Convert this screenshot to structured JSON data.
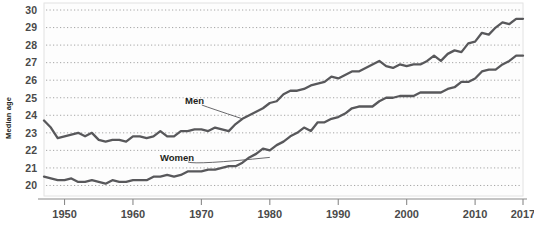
{
  "chart_data": {
    "type": "line",
    "title": "",
    "subtitle": "",
    "xlabel": "",
    "ylabel": "Median age",
    "xlim": [
      1947,
      2017
    ],
    "ylim": [
      19.4,
      30.4
    ],
    "grid": true,
    "legend_position": "inline-annotation",
    "x_ticks": [
      "1950",
      "1960",
      "1970",
      "1980",
      "1990",
      "2000",
      "2010",
      "2017"
    ],
    "x_tick_values": [
      1950,
      1960,
      1970,
      1980,
      1990,
      2000,
      2010,
      2017
    ],
    "y_ticks": [
      "20",
      "21",
      "22",
      "23",
      "24",
      "25",
      "26",
      "27",
      "28",
      "29",
      "30"
    ],
    "y_tick_values": [
      20,
      21,
      22,
      23,
      24,
      25,
      26,
      27,
      28,
      29,
      30
    ],
    "x": [
      1947,
      1948,
      1949,
      1950,
      1951,
      1952,
      1953,
      1954,
      1955,
      1956,
      1957,
      1958,
      1959,
      1960,
      1961,
      1962,
      1963,
      1964,
      1965,
      1966,
      1967,
      1968,
      1969,
      1970,
      1971,
      1972,
      1973,
      1974,
      1975,
      1976,
      1977,
      1978,
      1979,
      1980,
      1981,
      1982,
      1983,
      1984,
      1985,
      1986,
      1987,
      1988,
      1989,
      1990,
      1991,
      1992,
      1993,
      1994,
      1995,
      1996,
      1997,
      1998,
      1999,
      2000,
      2001,
      2002,
      2003,
      2004,
      2005,
      2006,
      2007,
      2008,
      2009,
      2010,
      2011,
      2012,
      2013,
      2014,
      2015,
      2016,
      2017
    ],
    "series": [
      {
        "name": "Men",
        "label": "Men",
        "color": "#58585b",
        "values": [
          23.7,
          23.3,
          22.7,
          22.8,
          22.9,
          23.0,
          22.8,
          23.0,
          22.6,
          22.5,
          22.6,
          22.6,
          22.5,
          22.8,
          22.8,
          22.7,
          22.8,
          23.1,
          22.8,
          22.8,
          23.1,
          23.1,
          23.2,
          23.2,
          23.1,
          23.3,
          23.2,
          23.1,
          23.5,
          23.8,
          24.0,
          24.2,
          24.4,
          24.7,
          24.8,
          25.2,
          25.4,
          25.4,
          25.5,
          25.7,
          25.8,
          25.9,
          26.2,
          26.1,
          26.3,
          26.5,
          26.5,
          26.7,
          26.9,
          27.1,
          26.8,
          26.7,
          26.9,
          26.8,
          26.9,
          26.9,
          27.1,
          27.4,
          27.1,
          27.5,
          27.7,
          27.6,
          28.1,
          28.2,
          28.7,
          28.6,
          29.0,
          29.3,
          29.2,
          29.5,
          29.5
        ]
      },
      {
        "name": "Women",
        "label": "Women",
        "color": "#58585b",
        "values": [
          20.5,
          20.4,
          20.3,
          20.3,
          20.4,
          20.2,
          20.2,
          20.3,
          20.2,
          20.1,
          20.3,
          20.2,
          20.2,
          20.3,
          20.3,
          20.3,
          20.5,
          20.5,
          20.6,
          20.5,
          20.6,
          20.8,
          20.8,
          20.8,
          20.9,
          20.9,
          21.0,
          21.1,
          21.1,
          21.3,
          21.6,
          21.8,
          22.1,
          22.0,
          22.3,
          22.5,
          22.8,
          23.0,
          23.3,
          23.1,
          23.6,
          23.6,
          23.8,
          23.9,
          24.1,
          24.4,
          24.5,
          24.5,
          24.5,
          24.8,
          25.0,
          25.0,
          25.1,
          25.1,
          25.1,
          25.3,
          25.3,
          25.3,
          25.3,
          25.5,
          25.6,
          25.9,
          25.9,
          26.1,
          26.5,
          26.6,
          26.6,
          26.9,
          27.1,
          27.4,
          27.4
        ]
      }
    ],
    "annotations": [
      {
        "text": "Men",
        "target_year": 1976,
        "target_value": 23.8
      },
      {
        "text": "Women",
        "target_year": 1980,
        "target_value": 21.6
      }
    ]
  }
}
